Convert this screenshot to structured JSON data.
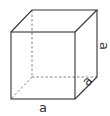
{
  "diagram": {
    "type": "cube",
    "stroke_color": "#333333",
    "hidden_edge_color": "#777777",
    "labels": {
      "width": "a",
      "depth": "a",
      "height": "a"
    }
  }
}
